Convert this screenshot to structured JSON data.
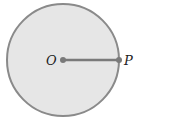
{
  "diagram": {
    "type": "circle-radius",
    "center_label": "O",
    "point_label": "P",
    "colors": {
      "fill": "#e6e6e6",
      "stroke": "#8a8a8a",
      "segment": "#7a7a7a",
      "point": "#7a7a7a"
    }
  }
}
